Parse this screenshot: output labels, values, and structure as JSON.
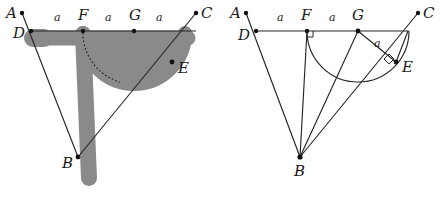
{
  "figure": {
    "stroke_color": "#262626",
    "shade_color": "#8a8a8a",
    "background": "#ffffff",
    "segment_length_symbol": "a"
  },
  "panels": [
    {
      "id": "left",
      "style": "shaded-dilated",
      "filled": true,
      "labels": {
        "A": "A",
        "B": "B",
        "C": "C",
        "D": "D",
        "E": "E",
        "F": "F",
        "G": "G"
      },
      "length_marks": [
        "a",
        "a",
        "a"
      ],
      "points": {
        "A": [
          22,
          13
        ],
        "D": [
          31,
          31
        ],
        "F": [
          83,
          31
        ],
        "G": [
          134,
          31
        ],
        "C": [
          196,
          13
        ],
        "E": [
          172,
          62
        ],
        "B": [
          78,
          157
        ]
      },
      "right_angles": [],
      "arc": {
        "center": "G",
        "radius_label": "a",
        "type": "semicircle"
      }
    },
    {
      "id": "right",
      "style": "line-art",
      "filled": false,
      "labels": {
        "A": "A",
        "B": "B",
        "C": "C",
        "D": "D",
        "E": "E",
        "F": "F",
        "G": "G"
      },
      "length_marks": [
        "a",
        "a",
        "a"
      ],
      "points": {
        "A": [
          24,
          13
        ],
        "D": [
          34,
          31
        ],
        "F": [
          85,
          31
        ],
        "G": [
          136,
          31
        ],
        "C": [
          196,
          13
        ],
        "E": [
          174,
          62
        ],
        "B": [
          78,
          157
        ]
      },
      "right_angles": [
        "F",
        "E"
      ],
      "arc": {
        "center": "G",
        "radius_label": "a",
        "type": "semicircle"
      }
    }
  ]
}
